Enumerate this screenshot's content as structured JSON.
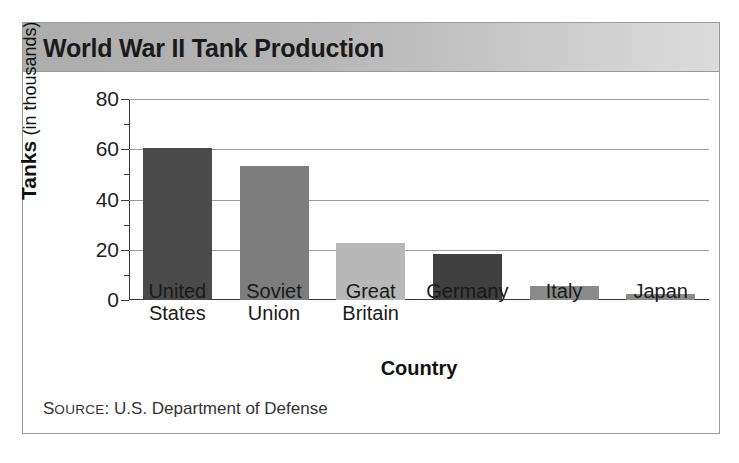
{
  "chart_data": {
    "type": "bar",
    "title": "World War II Tank Production",
    "xlabel": "Country",
    "ylabel": "Tanks (in thousands)",
    "ylabel_bold_part": "Tanks",
    "ylabel_light_part": "(in thousands)",
    "categories": [
      "United States",
      "Soviet Union",
      "Great Britain",
      "Germany",
      "Italy",
      "Japan"
    ],
    "values": [
      60.5,
      53.5,
      22.5,
      18.5,
      5.5,
      2.5
    ],
    "bar_colors": [
      "#4a4a4a",
      "#7d7d7d",
      "#b8b8b8",
      "#3f3f3f",
      "#8a8a8a",
      "#8a8a8a"
    ],
    "ylim": [
      0,
      80
    ],
    "ytick_labels": [
      "0",
      "20",
      "40",
      "60",
      "80"
    ],
    "ytick_values": [
      0,
      20,
      40,
      60,
      80
    ],
    "minor_tick_values": [
      10,
      30,
      50,
      70
    ],
    "grid": "horizontal",
    "legend": "none",
    "source": "SOURCE: U.S. Department of Defense",
    "source_small_caps_lead": "S",
    "source_small_caps_rest": "OURCE",
    "source_rest": ": U.S. Department of Defense"
  },
  "panel": {
    "header_gradient_from": "#adadad",
    "header_gradient_to": "#dcdcdc",
    "border_color": "#9a9a9a",
    "gridline_color": "#9c9c9c",
    "axis_color": "#3a3a3a"
  },
  "category_lines": [
    [
      "United",
      "States"
    ],
    [
      "Soviet",
      "Union"
    ],
    [
      "Great",
      "Britain"
    ],
    [
      "Germany",
      ""
    ],
    [
      "Italy",
      ""
    ],
    [
      "Japan",
      ""
    ]
  ]
}
